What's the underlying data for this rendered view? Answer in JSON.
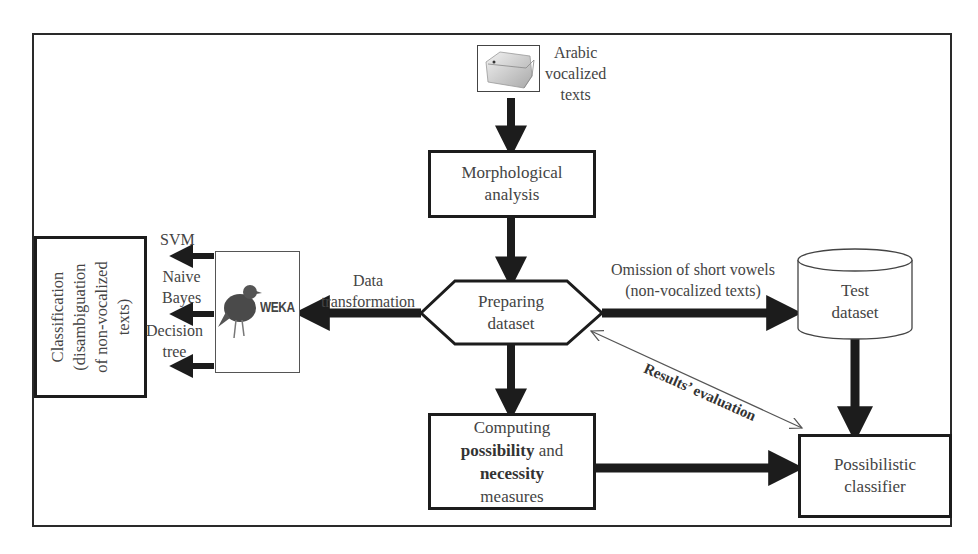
{
  "diagram": {
    "type": "flowchart",
    "nodes": {
      "input": {
        "label_lines": [
          "Arabic",
          "vocalized",
          "texts"
        ],
        "icon": "folder-icon"
      },
      "morph": {
        "label_lines": [
          "Morphological",
          "analysis"
        ]
      },
      "prepare": {
        "label_lines": [
          "Preparing",
          "dataset"
        ],
        "shape": "hexagon"
      },
      "test": {
        "label_lines": [
          "Test",
          "dataset"
        ],
        "shape": "cylinder"
      },
      "compute": {
        "line1": "Computing",
        "line2_bold": "possibility",
        "line2_rest": " and",
        "line3_bold": "necessity",
        "line4": "measures"
      },
      "classifier": {
        "label_lines": [
          "Possibilistic",
          "classifier"
        ]
      },
      "weka": {
        "logo_text": "WEKA"
      },
      "classification": {
        "label_lines": [
          "Classification",
          "(disambiguation",
          "of non-vocalized",
          "texts)"
        ]
      }
    },
    "edge_labels": {
      "data_transformation": [
        "Data",
        "transformation"
      ],
      "omission": [
        "Omission of  short vowels",
        "(non-vocalized texts)"
      ],
      "evaluation": "Results’ evaluation"
    },
    "algorithms": [
      {
        "label_lines": [
          "SVM"
        ]
      },
      {
        "label_lines": [
          "Naive",
          "Bayes"
        ]
      },
      {
        "label_lines": [
          "Decision",
          "tree"
        ]
      }
    ],
    "colors": {
      "stroke": "#1c1c1c",
      "text": "#444444",
      "background": "#ffffff"
    }
  }
}
